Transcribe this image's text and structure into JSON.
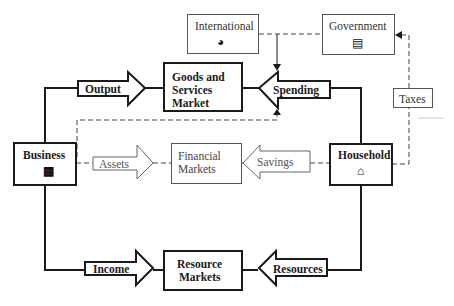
{
  "diagram": {
    "type": "circular-flow",
    "nodes": {
      "international": {
        "label": "International",
        "icon": "globe-icon"
      },
      "government": {
        "label": "Government",
        "icon": "building-icon"
      },
      "goods_market": {
        "line1": "Goods and",
        "line2": "Services",
        "line3": "Market"
      },
      "business": {
        "label": "Business",
        "icon": "factory-icon"
      },
      "financial_markets": {
        "line1": "Financial",
        "line2": "Markets"
      },
      "household": {
        "label": "Household",
        "icon": "house-icon"
      },
      "resource_markets": {
        "line1": "Resource",
        "line2": "Markets"
      },
      "taxes": {
        "label": "Taxes"
      }
    },
    "flows": {
      "output": {
        "label": "Output",
        "direction": "right"
      },
      "spending": {
        "label": "Spending",
        "direction": "left"
      },
      "assets": {
        "label": "Assets",
        "direction": "right"
      },
      "savings": {
        "label": "Savings",
        "direction": "left"
      },
      "income": {
        "label": "Income",
        "direction": "right"
      },
      "resources": {
        "label": "Resources",
        "direction": "left"
      }
    },
    "colors": {
      "solid": "#1a1a1a",
      "light": "#555555"
    }
  }
}
